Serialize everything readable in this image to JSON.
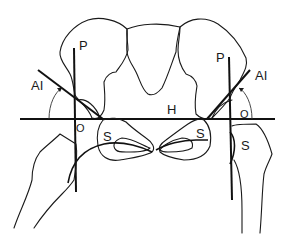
{
  "diagram": {
    "type": "anatomical line drawing",
    "colors": {
      "line": "#1a1a1a",
      "background": "#ffffff"
    },
    "labels": {
      "left_P": "P",
      "right_P": "P",
      "left_AI": "AI",
      "right_AI": "AI",
      "horizontal_H": "H",
      "left_S_upper": "S",
      "right_S_upper": "S",
      "right_S_lower": "S",
      "left_O": "O",
      "right_O": "O"
    }
  }
}
